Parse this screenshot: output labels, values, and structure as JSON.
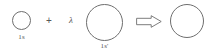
{
  "diagram": {
    "stroke_color": "#6e6e6e",
    "text_color": "#585858",
    "background_color": "#ffffff",
    "terms": [
      {
        "id": "orbital-1s",
        "icon": "circle-outline",
        "label": "1s",
        "cx": 21.5,
        "cy": 20.5,
        "r": 9.5,
        "stroke_width": 0.9,
        "label_x": 21.5,
        "label_y": 33.5
      },
      {
        "id": "orbital-1s-prime",
        "icon": "circle-outline",
        "label": "1s'",
        "cx": 104.5,
        "cy": 22.5,
        "r": 18.5,
        "stroke_width": 1.0,
        "label_x": 104.5,
        "label_y": 43.0
      },
      {
        "id": "orbital-result",
        "icon": "circle-outline",
        "label": "",
        "cx": 187.0,
        "cy": 21.0,
        "r": 17.0,
        "stroke_width": 1.0,
        "label_x": 187.0,
        "label_y": 43.0
      }
    ],
    "operators": [
      {
        "id": "plus-operator",
        "icon": "plus-sign",
        "symbol": "+",
        "x": 49.0,
        "y": 20.5
      },
      {
        "id": "lambda-coefficient",
        "icon": "lambda-symbol",
        "symbol": "λ",
        "x": 71.0,
        "y": 20.5
      }
    ],
    "arrow": {
      "id": "implies-arrow",
      "icon": "double-right-arrow",
      "symbol": "⇒",
      "x": 136.0,
      "y": 14.5,
      "width": 26.0,
      "height": 13.0
    }
  }
}
